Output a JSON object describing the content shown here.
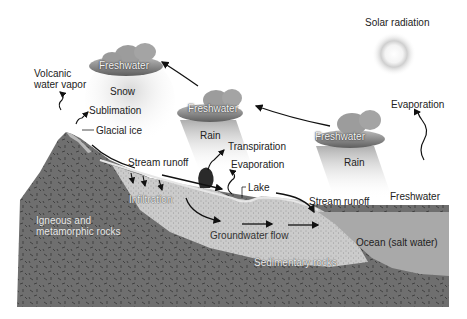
{
  "diagram": {
    "colors": {
      "background": "#ffffff",
      "igneous_rock": "#6f6f6f",
      "rock_speckle": "#3e3e3e",
      "sedimentary": "#c9c9c9",
      "ocean": "#a9a9a9",
      "glacial_ice": "#b5b5b5",
      "cloud": "#8a8a8a",
      "arrow": "#111111",
      "tree": "#2a2a2a",
      "sun_halo": "#cfcfcf"
    },
    "labels": {
      "solar_radiation": "Solar radiation",
      "volcanic_water_vapor": "Volcanic\nwater vapor",
      "sublimation": "Sublimation",
      "glacial_ice": "Glacial ice",
      "snow": "Snow",
      "rain_1": "Rain",
      "rain_2": "Rain",
      "cloud_1": "Freshwater",
      "cloud_2": "Freshwater",
      "cloud_3": "Freshwater",
      "transpiration": "Transpiration",
      "evaporation_land": "Evaporation",
      "evaporation_ocean": "Evaporation",
      "freshwater_ocean": "Freshwater",
      "stream_runoff_1": "Stream runoff",
      "stream_runoff_2": "Stream runoff",
      "lake": "Lake",
      "infiltration": "Infiltration",
      "groundwater_flow": "Groundwater flow",
      "igneous_rocks": "Igneous and\nmetamorphic rocks",
      "sedimentary_rocks": "Sedimentary rocks",
      "ocean": "Ocean (salt water)"
    }
  }
}
